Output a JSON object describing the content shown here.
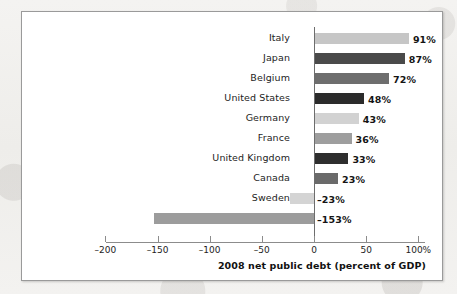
{
  "chart_data": {
    "type": "bar",
    "orientation": "horizontal",
    "title": "",
    "xlabel": "2008 net public debt (percent of GDP)",
    "ylabel": "",
    "xlim": [
      -200,
      100
    ],
    "grid": false,
    "legend": null,
    "categories": [
      "Italy",
      "Japan",
      "Belgium",
      "United States",
      "Germany",
      "France",
      "United Kingdom",
      "Canada",
      "Sweden",
      "Norway"
    ],
    "values": [
      91,
      87,
      72,
      48,
      43,
      36,
      33,
      23,
      -23,
      -153
    ],
    "data_labels": [
      "91%",
      "87%",
      "72%",
      "48%",
      "43%",
      "36%",
      "33%",
      "23%",
      "–23%",
      "–153%"
    ],
    "bar_colors": [
      "#c6c6c6",
      "#4a4a4a",
      "#6e6e6e",
      "#2b2b2b",
      "#d2d2d2",
      "#9e9e9e",
      "#2e2e2e",
      "#6a6a6a",
      "#d4d4d4",
      "#9c9c9c"
    ],
    "xticks": [
      -200,
      -150,
      -100,
      -50,
      0,
      50,
      100
    ],
    "xtick_labels": [
      "–200",
      "–150",
      "–100",
      "–50",
      "0",
      "50",
      "100%"
    ]
  },
  "figure": {
    "frame_color": "#9a9a9a",
    "background": "#ffffff",
    "page_background": "#f2f1ef"
  }
}
